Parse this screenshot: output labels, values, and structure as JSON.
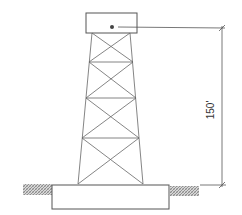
{
  "diagram": {
    "dimension": {
      "label": "150'",
      "orientation": "vertical"
    },
    "colors": {
      "line": "#555555",
      "hatch": "#888888",
      "background": "#ffffff"
    }
  }
}
